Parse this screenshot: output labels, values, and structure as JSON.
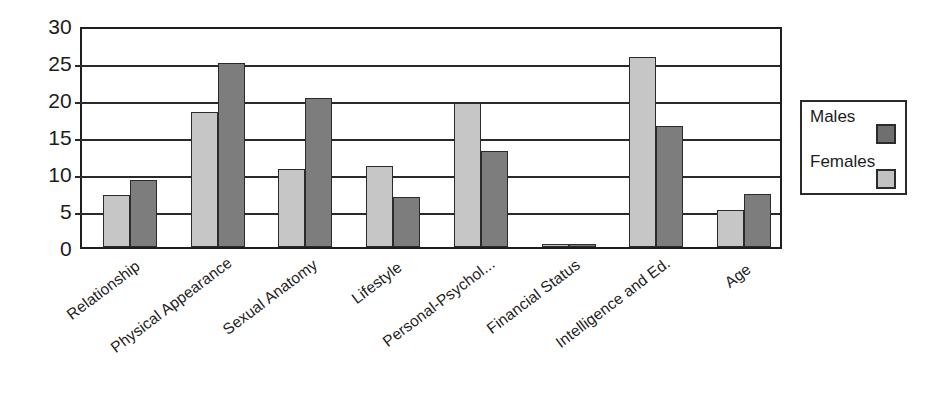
{
  "chart_data": {
    "type": "bar",
    "title": "",
    "subtitle": "",
    "xlabel": "",
    "ylabel": "",
    "ylim": [
      0,
      30
    ],
    "yticks": [
      0,
      5,
      10,
      15,
      20,
      25,
      30
    ],
    "grid": true,
    "legend_position": "right",
    "categories": [
      "Relationship",
      "Physical Appearance",
      "Sexual Anatomy",
      "Lifestyle",
      "Personal-Psychol...",
      "Financial Status",
      "Intelligence and Ed.",
      "Age"
    ],
    "series": [
      {
        "name": "Females",
        "color": "#c6c6c6",
        "values": [
          7.0,
          18.3,
          10.5,
          11.0,
          19.4,
          0.2,
          25.7,
          5.0
        ]
      },
      {
        "name": "Males",
        "color": "#7d7d7d",
        "values": [
          9.0,
          24.8,
          20.2,
          6.8,
          13.0,
          0.4,
          16.3,
          7.1
        ]
      }
    ]
  },
  "legend": {
    "entries": [
      {
        "label": "Males",
        "swatch": "dark"
      },
      {
        "label": "Females",
        "swatch": "light"
      }
    ]
  }
}
